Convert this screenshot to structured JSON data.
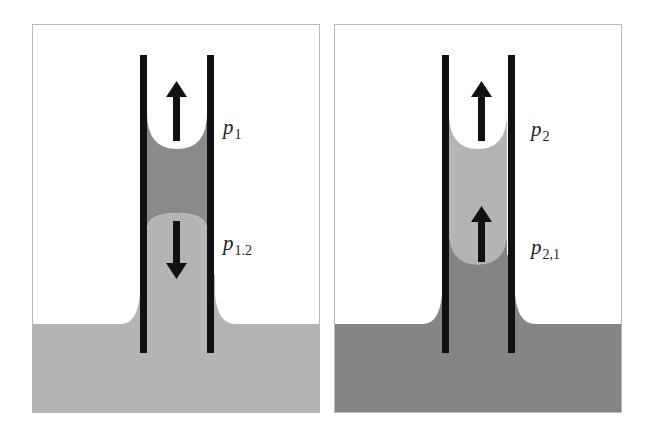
{
  "figure": {
    "panels": [
      {
        "id": "left",
        "description": "Capillary tube with dark liquid column above light liquid; light liquid in reservoir",
        "colors": {
          "reservoir": "#b4b4b4",
          "upper_liquid": "#8a8a8a",
          "lower_liquid": "#b4b4b4",
          "tube": "#111111"
        },
        "arrows": [
          {
            "direction": "up",
            "position": "upper meniscus"
          },
          {
            "direction": "down",
            "position": "lower meniscus"
          }
        ],
        "labels": {
          "upper": {
            "symbol": "p",
            "subscript": "1"
          },
          "lower": {
            "symbol": "p",
            "subscript": "1.2"
          }
        }
      },
      {
        "id": "right",
        "description": "Capillary tube with light liquid column above dark liquid; dark liquid in reservoir",
        "colors": {
          "reservoir": "#858585",
          "upper_liquid": "#b4b4b4",
          "lower_liquid": "#858585",
          "tube": "#111111"
        },
        "arrows": [
          {
            "direction": "up",
            "position": "upper meniscus"
          },
          {
            "direction": "up",
            "position": "lower meniscus"
          }
        ],
        "labels": {
          "upper": {
            "symbol": "p",
            "subscript": "2"
          },
          "lower": {
            "symbol": "p",
            "subscript": "2,1"
          }
        }
      }
    ]
  }
}
